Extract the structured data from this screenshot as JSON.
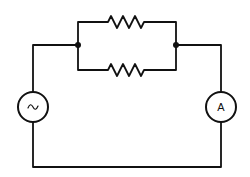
{
  "diagram": {
    "type": "circuit-schematic",
    "colors": {
      "wire": "#111111",
      "background": "#ffffff"
    },
    "components": [
      {
        "id": "ac-source",
        "kind": "ac-voltage-source",
        "symbol": "~",
        "cx": 33,
        "cy": 107,
        "r": 15
      },
      {
        "id": "ammeter",
        "kind": "ammeter",
        "label": "A",
        "cx": 221,
        "cy": 107,
        "r": 15
      },
      {
        "id": "resistor-top",
        "kind": "resistor",
        "x1": 108,
        "x2": 144,
        "y": 22
      },
      {
        "id": "resistor-bottom",
        "kind": "resistor",
        "x1": 108,
        "x2": 144,
        "y": 70
      },
      {
        "id": "junction-left",
        "kind": "junction",
        "cx": 78,
        "cy": 45
      },
      {
        "id": "junction-right",
        "kind": "junction",
        "cx": 176,
        "cy": 45
      }
    ],
    "labels": {
      "ac_symbol": "~",
      "ammeter_label": "A"
    }
  }
}
